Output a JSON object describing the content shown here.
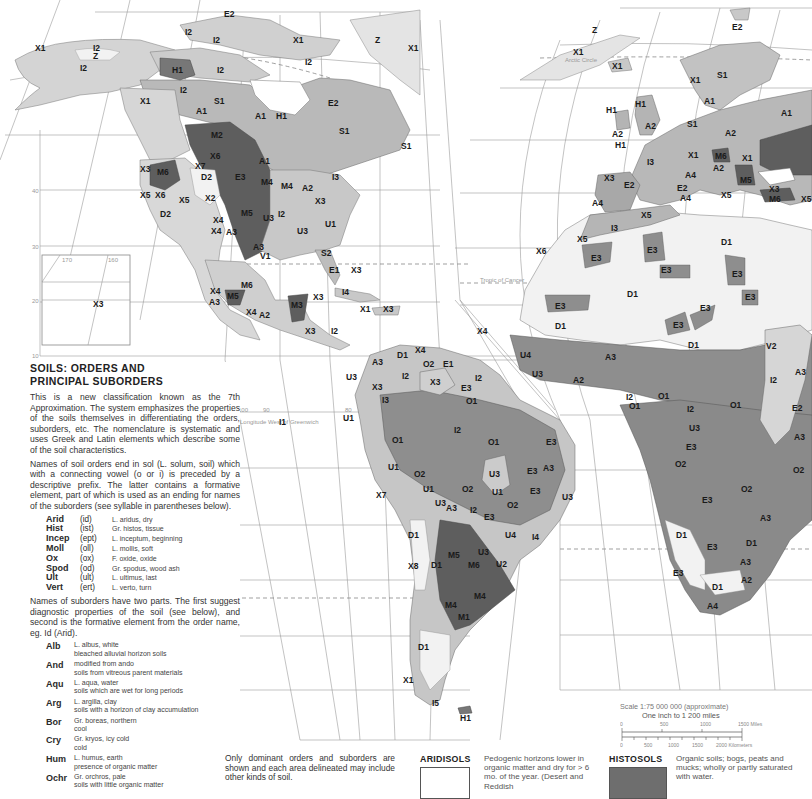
{
  "panel": {
    "title_line1": "SOILS: ORDERS AND",
    "title_line2": "PRINCIPAL SUBORDERS",
    "intro": "This is a new classification known as the 7th Approximation. The system emphasizes the properties of the soils themselves in differentiating the orders, suborders, etc. The nomenclature is systematic and uses Greek and Latin elements which describe some of the soil characteristics.",
    "orders_intro": "Names of soil orders end in sol (L. solum, soil) which with a connecting vowel (o or i) is preceded by a descriptive prefix. The latter contains a formative element, part of which is used as an ending for names of the suborders (see syllable in parentheses below).",
    "orders": [
      {
        "name": "Arid",
        "syl": "(id)",
        "desc": "L. aridus, dry"
      },
      {
        "name": "Hist",
        "syl": "(ist)",
        "desc": "Gr. histos, tissue"
      },
      {
        "name": "Incep",
        "syl": "(ept)",
        "desc": "L. inceptum, beginning"
      },
      {
        "name": "Moll",
        "syl": "(oll)",
        "desc": "L. mollis, soft"
      },
      {
        "name": "Ox",
        "syl": "(ox)",
        "desc": "F. oxide, oxide"
      },
      {
        "name": "Spod",
        "syl": "(od)",
        "desc": "Gr. spodus, wood ash"
      },
      {
        "name": "Ult",
        "syl": "(ult)",
        "desc": "L. ultimus, last"
      },
      {
        "name": "Vert",
        "syl": "(ert)",
        "desc": "L. verto, turn"
      }
    ],
    "suborders_intro": "Names of suborders have two parts. The first suggest diagnostic properties of the soil (see below), and second is the formative element from the order name, eg. Id (Arid).",
    "suborders": [
      {
        "name": "Alb",
        "l1": "L. albus, white",
        "l2": "bleached alluvial horizon soils"
      },
      {
        "name": "And",
        "l1": "modified from ando",
        "l2": "soils from vitreous parent materials"
      },
      {
        "name": "Aqu",
        "l1": "L. aqua, water",
        "l2": "soils which are wet for long periods"
      },
      {
        "name": "Arg",
        "l1": "L. argilla, clay",
        "l2": "soils with a horizon of clay accumulation"
      },
      {
        "name": "Bor",
        "l1": "Gr. boreas, northern",
        "l2": "cool"
      },
      {
        "name": "Cry",
        "l1": "Gr. kryos, icy cold",
        "l2": "cold"
      },
      {
        "name": "Hum",
        "l1": "L. humus, earth",
        "l2": "presence of organic matter"
      },
      {
        "name": "Ochr",
        "l1": "Gr. orchros, pale",
        "l2": "soils with little organic matter"
      }
    ]
  },
  "note": "Only dominant orders and suborders are shown and each area delineated may include other kinds of soil.",
  "legend": [
    {
      "name": "ARIDISOLS",
      "color": "#ffffff",
      "desc": "Pedogenic horizons lower in organic matter and dry for > 6 mo. of the year. (Desert and Reddish"
    },
    {
      "name": "HISTOSOLS",
      "color": "#6e6e6e",
      "desc": "Organic soils; bogs, peats and mucks; wholly or partly saturated with water."
    }
  ],
  "scale": {
    "line1": "Scale 1:75 000 000 (approximate)",
    "line2": "One inch to 1 200 miles",
    "miles_ticks": [
      "0",
      "500",
      "1000",
      "1500 Miles"
    ],
    "km_ticks": [
      "0",
      "500",
      "1000",
      "1500",
      "2000 Kilometers"
    ]
  },
  "map": {
    "colors": {
      "ocean": "#ffffff",
      "light": "#d4d4d4",
      "mid": "#b6b6b6",
      "dark": "#8c8c8c",
      "mollisol": "#5e5e5e",
      "desert": "#f2f2f2",
      "ice": "#ececec"
    },
    "graticule_labels": [
      "40",
      "30",
      "20",
      "10",
      "170",
      "160",
      "100",
      "90",
      "80",
      "70",
      "30",
      "20"
    ],
    "line_labels": [
      "Arctic Circle",
      "Tropic of Cancer",
      "Longitude West of Greenwich"
    ],
    "region_labels": [
      {
        "t": "X1",
        "x": 40,
        "y": 48
      },
      {
        "t": "I2",
        "x": 98,
        "y": 48
      },
      {
        "t": "Z",
        "x": 98,
        "y": 56
      },
      {
        "t": "I2",
        "x": 85,
        "y": 68
      },
      {
        "t": "E2",
        "x": 229,
        "y": 14
      },
      {
        "t": "I2",
        "x": 190,
        "y": 32
      },
      {
        "t": "I2",
        "x": 218,
        "y": 40
      },
      {
        "t": "X1",
        "x": 298,
        "y": 40
      },
      {
        "t": "Z",
        "x": 380,
        "y": 40
      },
      {
        "t": "X1",
        "x": 413,
        "y": 48
      },
      {
        "t": "H1",
        "x": 177,
        "y": 70
      },
      {
        "t": "I2",
        "x": 222,
        "y": 70
      },
      {
        "t": "I2",
        "x": 310,
        "y": 62
      },
      {
        "t": "I2",
        "x": 185,
        "y": 90
      },
      {
        "t": "X1",
        "x": 145,
        "y": 101
      },
      {
        "t": "S1",
        "x": 219,
        "y": 101
      },
      {
        "t": "A1",
        "x": 201,
        "y": 111
      },
      {
        "t": "A1",
        "x": 260,
        "y": 116
      },
      {
        "t": "H1",
        "x": 281,
        "y": 116
      },
      {
        "t": "E2",
        "x": 333,
        "y": 103
      },
      {
        "t": "S1",
        "x": 344,
        "y": 131
      },
      {
        "t": "S1",
        "x": 406,
        "y": 146
      },
      {
        "t": "M2",
        "x": 216,
        "y": 135
      },
      {
        "t": "X6",
        "x": 215,
        "y": 156
      },
      {
        "t": "A1",
        "x": 264,
        "y": 161
      },
      {
        "t": "X3",
        "x": 145,
        "y": 169
      },
      {
        "t": "M6",
        "x": 162,
        "y": 172
      },
      {
        "t": "X7",
        "x": 200,
        "y": 166
      },
      {
        "t": "D2",
        "x": 206,
        "y": 177
      },
      {
        "t": "E3",
        "x": 240,
        "y": 177
      },
      {
        "t": "M4",
        "x": 266,
        "y": 182
      },
      {
        "t": "M4",
        "x": 286,
        "y": 186
      },
      {
        "t": "A2",
        "x": 307,
        "y": 188
      },
      {
        "t": "I3",
        "x": 337,
        "y": 177
      },
      {
        "t": "X5",
        "x": 145,
        "y": 195
      },
      {
        "t": "X6",
        "x": 160,
        "y": 195
      },
      {
        "t": "X5",
        "x": 184,
        "y": 200
      },
      {
        "t": "X2",
        "x": 210,
        "y": 198
      },
      {
        "t": "X3",
        "x": 320,
        "y": 201
      },
      {
        "t": "D2",
        "x": 165,
        "y": 214
      },
      {
        "t": "X4",
        "x": 218,
        "y": 220
      },
      {
        "t": "M5",
        "x": 246,
        "y": 213
      },
      {
        "t": "U3",
        "x": 268,
        "y": 218
      },
      {
        "t": "I2",
        "x": 283,
        "y": 214
      },
      {
        "t": "X4",
        "x": 216,
        "y": 231
      },
      {
        "t": "A3",
        "x": 231,
        "y": 232
      },
      {
        "t": "U3",
        "x": 302,
        "y": 231
      },
      {
        "t": "U1",
        "x": 330,
        "y": 224
      },
      {
        "t": "A3",
        "x": 258,
        "y": 247
      },
      {
        "t": "V1",
        "x": 265,
        "y": 256
      },
      {
        "t": "S2",
        "x": 326,
        "y": 253
      },
      {
        "t": "E1",
        "x": 334,
        "y": 270
      },
      {
        "t": "X3",
        "x": 356,
        "y": 270
      },
      {
        "t": "X4",
        "x": 215,
        "y": 291
      },
      {
        "t": "M5",
        "x": 232,
        "y": 296
      },
      {
        "t": "M6",
        "x": 246,
        "y": 285
      },
      {
        "t": "X3",
        "x": 318,
        "y": 297
      },
      {
        "t": "I4",
        "x": 347,
        "y": 292
      },
      {
        "t": "A3",
        "x": 214,
        "y": 302
      },
      {
        "t": "X4",
        "x": 251,
        "y": 312
      },
      {
        "t": "A2",
        "x": 264,
        "y": 315
      },
      {
        "t": "M3",
        "x": 296,
        "y": 305
      },
      {
        "t": "X1",
        "x": 365,
        "y": 309
      },
      {
        "t": "X3",
        "x": 388,
        "y": 309
      },
      {
        "t": "X3",
        "x": 98,
        "y": 304
      },
      {
        "t": "X3",
        "x": 310,
        "y": 331
      },
      {
        "t": "I2",
        "x": 336,
        "y": 331
      },
      {
        "t": "D1",
        "x": 402,
        "y": 355
      },
      {
        "t": "X4",
        "x": 420,
        "y": 350
      },
      {
        "t": "A3",
        "x": 377,
        "y": 362
      },
      {
        "t": "O2",
        "x": 428,
        "y": 364
      },
      {
        "t": "E1",
        "x": 448,
        "y": 364
      },
      {
        "t": "U3",
        "x": 351,
        "y": 377
      },
      {
        "t": "I2",
        "x": 407,
        "y": 376
      },
      {
        "t": "X3",
        "x": 435,
        "y": 382
      },
      {
        "t": "X3",
        "x": 377,
        "y": 387
      },
      {
        "t": "E3",
        "x": 466,
        "y": 388
      },
      {
        "t": "I2",
        "x": 480,
        "y": 378
      },
      {
        "t": "I3",
        "x": 387,
        "y": 400
      },
      {
        "t": "O1",
        "x": 471,
        "y": 401
      },
      {
        "t": "I1",
        "x": 284,
        "y": 422
      },
      {
        "t": "U1",
        "x": 348,
        "y": 418
      },
      {
        "t": "I2",
        "x": 459,
        "y": 430
      },
      {
        "t": "O1",
        "x": 397,
        "y": 440
      },
      {
        "t": "O1",
        "x": 493,
        "y": 442
      },
      {
        "t": "E3",
        "x": 551,
        "y": 442
      },
      {
        "t": "U1",
        "x": 393,
        "y": 467
      },
      {
        "t": "O2",
        "x": 419,
        "y": 474
      },
      {
        "t": "U3",
        "x": 494,
        "y": 474
      },
      {
        "t": "E3",
        "x": 532,
        "y": 471
      },
      {
        "t": "A3",
        "x": 548,
        "y": 468
      },
      {
        "t": "U1",
        "x": 428,
        "y": 489
      },
      {
        "t": "O2",
        "x": 467,
        "y": 489
      },
      {
        "t": "U1",
        "x": 497,
        "y": 492
      },
      {
        "t": "X7",
        "x": 381,
        "y": 495
      },
      {
        "t": "E3",
        "x": 535,
        "y": 491
      },
      {
        "t": "O2",
        "x": 512,
        "y": 505
      },
      {
        "t": "U3",
        "x": 567,
        "y": 497
      },
      {
        "t": "U3",
        "x": 440,
        "y": 503
      },
      {
        "t": "A3",
        "x": 451,
        "y": 508
      },
      {
        "t": "I2",
        "x": 475,
        "y": 510
      },
      {
        "t": "E3",
        "x": 489,
        "y": 517
      },
      {
        "t": "U4",
        "x": 510,
        "y": 535
      },
      {
        "t": "I4",
        "x": 537,
        "y": 537
      },
      {
        "t": "D1",
        "x": 413,
        "y": 535
      },
      {
        "t": "M5",
        "x": 453,
        "y": 555
      },
      {
        "t": "U3",
        "x": 483,
        "y": 552
      },
      {
        "t": "X8",
        "x": 413,
        "y": 566
      },
      {
        "t": "D1",
        "x": 436,
        "y": 565
      },
      {
        "t": "M6",
        "x": 473,
        "y": 565
      },
      {
        "t": "U2",
        "x": 501,
        "y": 564
      },
      {
        "t": "M4",
        "x": 479,
        "y": 596
      },
      {
        "t": "M4",
        "x": 450,
        "y": 605
      },
      {
        "t": "M1",
        "x": 463,
        "y": 617
      },
      {
        "t": "D1",
        "x": 423,
        "y": 647
      },
      {
        "t": "X1",
        "x": 408,
        "y": 680
      },
      {
        "t": "I5",
        "x": 437,
        "y": 703
      },
      {
        "t": "H1",
        "x": 465,
        "y": 718
      },
      {
        "t": "Z",
        "x": 597,
        "y": 30
      },
      {
        "t": "E2",
        "x": 737,
        "y": 27
      },
      {
        "t": "X1",
        "x": 578,
        "y": 52
      },
      {
        "t": "X1",
        "x": 617,
        "y": 66
      },
      {
        "t": "X1",
        "x": 695,
        "y": 80
      },
      {
        "t": "S1",
        "x": 722,
        "y": 75
      },
      {
        "t": "A1",
        "x": 709,
        "y": 101
      },
      {
        "t": "A1",
        "x": 786,
        "y": 113
      },
      {
        "t": "H1",
        "x": 640,
        "y": 104
      },
      {
        "t": "H1",
        "x": 611,
        "y": 110
      },
      {
        "t": "A2",
        "x": 650,
        "y": 126
      },
      {
        "t": "A2",
        "x": 617,
        "y": 134
      },
      {
        "t": "H1",
        "x": 620,
        "y": 145
      },
      {
        "t": "S1",
        "x": 692,
        "y": 124
      },
      {
        "t": "A2",
        "x": 730,
        "y": 133
      },
      {
        "t": "X1",
        "x": 693,
        "y": 155
      },
      {
        "t": "M6",
        "x": 720,
        "y": 156
      },
      {
        "t": "X1",
        "x": 747,
        "y": 158
      },
      {
        "t": "I3",
        "x": 652,
        "y": 162
      },
      {
        "t": "A2",
        "x": 718,
        "y": 168
      },
      {
        "t": "A4",
        "x": 690,
        "y": 175
      },
      {
        "t": "M5",
        "x": 745,
        "y": 180
      },
      {
        "t": "X3",
        "x": 609,
        "y": 178
      },
      {
        "t": "E2",
        "x": 629,
        "y": 185
      },
      {
        "t": "X3",
        "x": 774,
        "y": 189
      },
      {
        "t": "M6",
        "x": 774,
        "y": 199
      },
      {
        "t": "E2",
        "x": 682,
        "y": 188
      },
      {
        "t": "A4",
        "x": 685,
        "y": 198
      },
      {
        "t": "A4",
        "x": 597,
        "y": 203
      },
      {
        "t": "X5",
        "x": 726,
        "y": 195
      },
      {
        "t": "X5",
        "x": 806,
        "y": 199
      },
      {
        "t": "X5",
        "x": 646,
        "y": 215
      },
      {
        "t": "I3",
        "x": 616,
        "y": 228
      },
      {
        "t": "X5",
        "x": 582,
        "y": 239
      },
      {
        "t": "X6",
        "x": 541,
        "y": 251
      },
      {
        "t": "E3",
        "x": 596,
        "y": 258
      },
      {
        "t": "E3",
        "x": 652,
        "y": 250
      },
      {
        "t": "D1",
        "x": 726,
        "y": 242
      },
      {
        "t": "E3",
        "x": 666,
        "y": 270
      },
      {
        "t": "E3",
        "x": 737,
        "y": 274
      },
      {
        "t": "E3",
        "x": 750,
        "y": 297
      },
      {
        "t": "D1",
        "x": 632,
        "y": 294
      },
      {
        "t": "E3",
        "x": 560,
        "y": 306
      },
      {
        "t": "E3",
        "x": 705,
        "y": 308
      },
      {
        "t": "E3",
        "x": 678,
        "y": 325
      },
      {
        "t": "D1",
        "x": 560,
        "y": 326
      },
      {
        "t": "D1",
        "x": 693,
        "y": 345
      },
      {
        "t": "X4",
        "x": 482,
        "y": 331
      },
      {
        "t": "V2",
        "x": 771,
        "y": 346
      },
      {
        "t": "U4",
        "x": 525,
        "y": 355
      },
      {
        "t": "A3",
        "x": 610,
        "y": 357
      },
      {
        "t": "U3",
        "x": 537,
        "y": 374
      },
      {
        "t": "A2",
        "x": 578,
        "y": 380
      },
      {
        "t": "A3",
        "x": 800,
        "y": 372
      },
      {
        "t": "I2",
        "x": 775,
        "y": 380
      },
      {
        "t": "I2",
        "x": 631,
        "y": 397
      },
      {
        "t": "O1",
        "x": 663,
        "y": 396
      },
      {
        "t": "O1",
        "x": 735,
        "y": 405
      },
      {
        "t": "O1",
        "x": 634,
        "y": 406
      },
      {
        "t": "I2",
        "x": 692,
        "y": 409
      },
      {
        "t": "E2",
        "x": 797,
        "y": 408
      },
      {
        "t": "U3",
        "x": 694,
        "y": 428
      },
      {
        "t": "A3",
        "x": 799,
        "y": 437
      },
      {
        "t": "E3",
        "x": 691,
        "y": 447
      },
      {
        "t": "O2",
        "x": 680,
        "y": 464
      },
      {
        "t": "O2",
        "x": 798,
        "y": 470
      },
      {
        "t": "E3",
        "x": 707,
        "y": 500
      },
      {
        "t": "O2",
        "x": 746,
        "y": 489
      },
      {
        "t": "A3",
        "x": 765,
        "y": 518
      },
      {
        "t": "D1",
        "x": 681,
        "y": 535
      },
      {
        "t": "D1",
        "x": 751,
        "y": 543
      },
      {
        "t": "E3",
        "x": 712,
        "y": 547
      },
      {
        "t": "A3",
        "x": 745,
        "y": 562
      },
      {
        "t": "A2",
        "x": 746,
        "y": 580
      },
      {
        "t": "E3",
        "x": 678,
        "y": 573
      },
      {
        "t": "D1",
        "x": 717,
        "y": 587
      },
      {
        "t": "A4",
        "x": 712,
        "y": 606
      }
    ]
  }
}
